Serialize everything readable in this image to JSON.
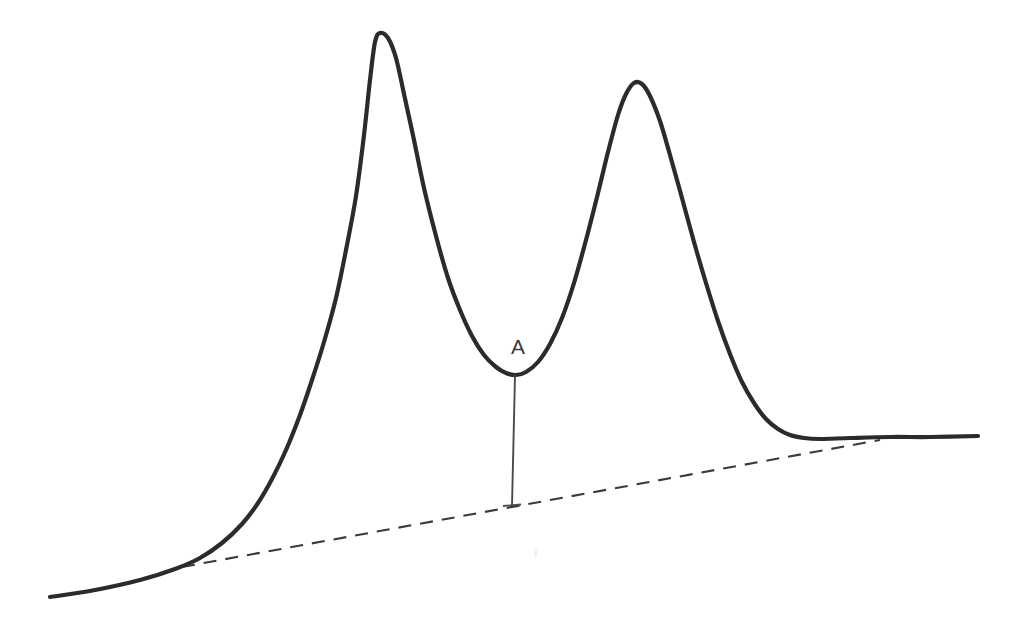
{
  "figure": {
    "title": "",
    "label_a": "A",
    "background_color": "#ffffff",
    "trace_color": "#2b2b2b",
    "baseline_color": "#3a3a3a",
    "dropline_color": "#4a4a4a",
    "label_color": "#3b3b3b"
  },
  "chart_data": {
    "type": "line",
    "title": "",
    "subtitle": "",
    "xlabel": "",
    "ylabel": "",
    "xlim": [
      0,
      1014
    ],
    "ylim": [
      0,
      631
    ],
    "grid": false,
    "legend": null,
    "axes_visible": false,
    "series": [
      {
        "name": "signal-trace",
        "style": "solid",
        "color": "#2b2b2b",
        "width": 4.2,
        "points": [
          [
            50,
            597
          ],
          [
            95,
            590
          ],
          [
            140,
            580
          ],
          [
            175,
            569
          ],
          [
            200,
            558
          ],
          [
            222,
            543
          ],
          [
            242,
            524
          ],
          [
            258,
            503
          ],
          [
            272,
            479
          ],
          [
            286,
            450
          ],
          [
            300,
            415
          ],
          [
            312,
            380
          ],
          [
            324,
            342
          ],
          [
            336,
            298
          ],
          [
            346,
            250
          ],
          [
            356,
            196
          ],
          [
            364,
            135
          ],
          [
            370,
            80
          ],
          [
            375,
            42
          ],
          [
            380,
            33
          ],
          [
            388,
            38
          ],
          [
            396,
            58
          ],
          [
            404,
            94
          ],
          [
            414,
            140
          ],
          [
            424,
            188
          ],
          [
            436,
            236
          ],
          [
            448,
            278
          ],
          [
            460,
            310
          ],
          [
            472,
            336
          ],
          [
            484,
            355
          ],
          [
            496,
            367
          ],
          [
            506,
            373
          ],
          [
            516,
            375
          ],
          [
            526,
            372
          ],
          [
            538,
            362
          ],
          [
            550,
            344
          ],
          [
            562,
            318
          ],
          [
            574,
            283
          ],
          [
            586,
            240
          ],
          [
            598,
            193
          ],
          [
            608,
            152
          ],
          [
            618,
            115
          ],
          [
            626,
            94
          ],
          [
            634,
            83
          ],
          [
            642,
            84
          ],
          [
            650,
            96
          ],
          [
            660,
            121
          ],
          [
            670,
            155
          ],
          [
            682,
            198
          ],
          [
            694,
            242
          ],
          [
            706,
            283
          ],
          [
            718,
            321
          ],
          [
            730,
            354
          ],
          [
            742,
            382
          ],
          [
            754,
            403
          ],
          [
            766,
            419
          ],
          [
            778,
            429
          ],
          [
            790,
            435
          ],
          [
            804,
            438
          ],
          [
            820,
            439
          ],
          [
            850,
            438
          ],
          [
            890,
            437
          ],
          [
            930,
            437
          ],
          [
            978,
            436
          ]
        ]
      },
      {
        "name": "baseline",
        "style": "dashed",
        "color": "#3a3a3a",
        "width": 2.1,
        "points": [
          [
            182,
            567
          ],
          [
            880,
            440
          ]
        ]
      },
      {
        "name": "drop-line",
        "style": "solid",
        "color": "#4a4a4a",
        "width": 1.9,
        "points": [
          [
            515,
            375
          ],
          [
            512,
            506
          ]
        ]
      }
    ],
    "annotations": [
      {
        "text": "A",
        "x": 518,
        "y": 354,
        "color": "#3b3b3b",
        "font_size": 21
      }
    ]
  }
}
